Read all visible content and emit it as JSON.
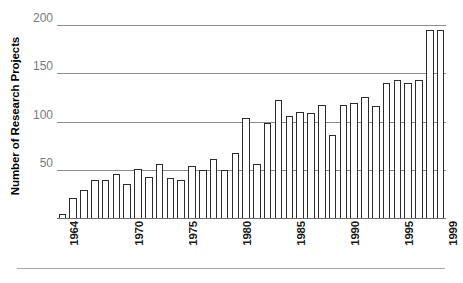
{
  "chart_data": {
    "type": "bar",
    "title": "",
    "subtitle": "",
    "xlabel": "",
    "ylabel": "Number of Research Projects",
    "ylim": [
      0,
      205
    ],
    "yticks": [
      50,
      100,
      150,
      200
    ],
    "ytick_labels": [
      "50",
      "100",
      "150",
      "200"
    ],
    "grid": true,
    "legend": null,
    "xtick_labels": [
      "1964",
      "1970",
      "1975",
      "1980",
      "1985",
      "1990",
      "1995",
      "1999"
    ],
    "xtick_years": [
      1964,
      1970,
      1975,
      1980,
      1985,
      1990,
      1995,
      1999
    ],
    "categories": [
      "1964",
      "1965",
      "1966",
      "1967",
      "1968",
      "1969",
      "1970",
      "1971",
      "1972",
      "1973",
      "1974",
      "1975",
      "1976",
      "1977",
      "1978",
      "1979",
      "1980",
      "1981",
      "1982",
      "1983",
      "1984",
      "1985",
      "1986",
      "1987",
      "1988",
      "1989",
      "1990",
      "1991",
      "1992",
      "1993",
      "1994",
      "1995",
      "1996",
      "1997",
      "1998",
      "1999"
    ],
    "values": [
      5,
      22,
      30,
      40,
      40,
      46,
      36,
      52,
      43,
      57,
      42,
      40,
      55,
      50,
      62,
      50,
      68,
      104,
      57,
      99,
      123,
      106,
      110,
      109,
      117,
      87,
      117,
      120,
      126,
      116,
      140,
      143,
      140,
      143,
      195,
      195
    ],
    "values_note": "Bar heights read off the gridlines; final bar 1999 = 200",
    "colors": {
      "bar_fill": "#ffffff",
      "bar_edge": "#2b2b2b",
      "gridline": "#8c8c8c",
      "ytick_text": "#7a7a7a",
      "xtick_text": "#1a1a1a",
      "axis_title": "#000000",
      "background": "#ffffff"
    }
  }
}
